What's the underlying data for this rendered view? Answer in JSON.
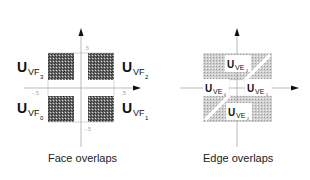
{
  "figure": {
    "panels": [
      {
        "id": "face",
        "caption": "Face overlaps",
        "ticks": {
          "top": ".5",
          "bottom": "-.5",
          "left": "-.5",
          "right": ".5"
        },
        "labels": [
          {
            "main": "U",
            "sub": "VF",
            "subsub": "3",
            "position": "top-left"
          },
          {
            "main": "U",
            "sub": "VF",
            "subsub": "2",
            "position": "top-right"
          },
          {
            "main": "U",
            "sub": "VF",
            "subsub": "0",
            "position": "bottom-left"
          },
          {
            "main": "U",
            "sub": "VF",
            "subsub": "1",
            "position": "bottom-right"
          }
        ]
      },
      {
        "id": "edge",
        "caption": "Edge overlaps",
        "labels": [
          {
            "main": "U",
            "sub": "VE",
            "subsub": "3",
            "position": "top"
          },
          {
            "main": "U",
            "sub": "VE",
            "subsub": "0",
            "position": "left"
          },
          {
            "main": "U",
            "sub": "VE",
            "subsub": "1",
            "position": "right"
          },
          {
            "main": "U",
            "sub": "VE",
            "subsub": "2",
            "position": "bottom"
          }
        ]
      }
    ],
    "colors": {
      "dark_fill": "#555555",
      "light_fill": "#c8c8c8",
      "axis": "#aaaaaa",
      "arrow": "#111111"
    }
  }
}
